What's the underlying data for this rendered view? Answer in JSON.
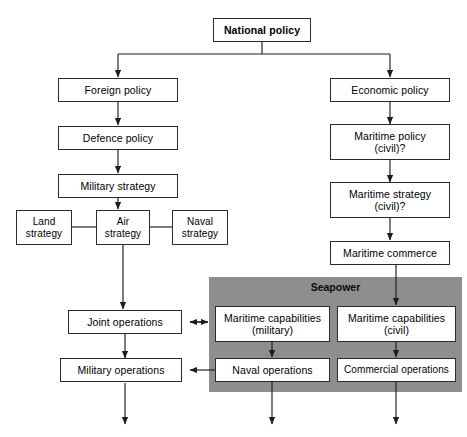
{
  "diagram": {
    "colors": {
      "panel_fill": "#8e8e8e",
      "node_fill": "#ffffff",
      "stroke": "#2b2b2b",
      "background": "#ffffff"
    },
    "panel": {
      "label": "Seapower"
    },
    "nodes": {
      "national_policy": "National policy",
      "foreign_policy": "Foreign policy",
      "defence_policy": "Defence policy",
      "military_strategy": "Military strategy",
      "land_strategy": "Land\nstrategy",
      "air_strategy": "Air\nstrategy",
      "naval_strategy": "Naval\nstrategy",
      "joint_operations": "Joint operations",
      "military_operations": "Military operations",
      "economic_policy": "Economic policy",
      "maritime_policy_civil": "Maritime policy\n(civil)?",
      "maritime_strategy_civil": "Maritime strategy\n(civil)?",
      "maritime_commerce": "Maritime commerce",
      "maritime_capabilities_military": "Maritime capabilities\n(military)",
      "maritime_capabilities_civil": "Maritime capabilities\n(civil)",
      "naval_operations": "Naval operations",
      "commercial_operations": "Commercial operations"
    }
  }
}
